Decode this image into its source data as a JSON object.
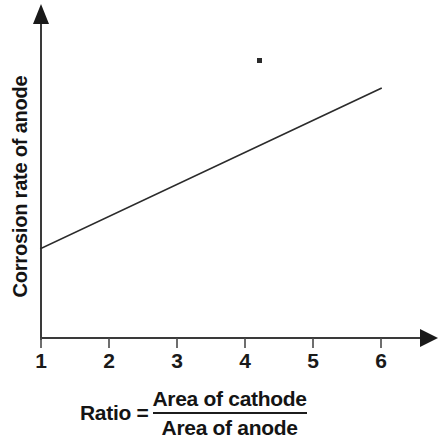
{
  "chart_data": {
    "type": "line",
    "title": "",
    "subtitle": "",
    "xlabel": "Ratio = Area of cathode / Area of anode",
    "ylabel": "Corrosion rate of anode",
    "xlabel_parts": {
      "prefix": "Ratio =",
      "numerator": "Area of cathode",
      "denominator": "Area of anode"
    },
    "x_tick_labels": [
      "1",
      "2",
      "3",
      "4",
      "5",
      "6"
    ],
    "x_tick_values": [
      1,
      2,
      3,
      4,
      5,
      6
    ],
    "y_tick_labels": [],
    "xlim": [
      1,
      6.9
    ],
    "ylim": [
      0,
      1
    ],
    "grid": false,
    "legend": null,
    "axes_arrows": {
      "x": "right",
      "y": "up"
    },
    "series": [
      {
        "name": "Corrosion rate of anode",
        "x": [
          1,
          2,
          3,
          4,
          5,
          6
        ],
        "y": [
          0.28,
          0.38,
          0.48,
          0.58,
          0.68,
          0.78
        ],
        "color": "#2b2b2b",
        "style": "solid straight line, increasing"
      }
    ],
    "annotations": [
      {
        "name": "scan-speck",
        "x_px": 259,
        "y_px": 60,
        "text": ""
      }
    ]
  },
  "geometry": {
    "origin_x": 41,
    "origin_y": 338,
    "tick_spacing": 68,
    "y_axis_top": 8,
    "x_axis_right": 428,
    "line_start_px": {
      "x": 41,
      "y": 281
    },
    "line_end_px": {
      "x": 387,
      "y": 91
    }
  },
  "colors": {
    "background": "#ffffff",
    "axis": "#3a3a3a",
    "data_line": "#2b2b2b",
    "text": "#141414"
  }
}
